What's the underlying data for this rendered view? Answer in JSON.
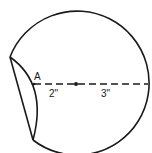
{
  "diagram": {
    "colors": {
      "background": "#ffffff",
      "stroke": "#1a1a1a"
    },
    "point_label": "A",
    "segments": [
      {
        "label": "2\"",
        "from": "A",
        "to": "center"
      },
      {
        "label": "3\"",
        "from": "center",
        "to": "circle-edge"
      }
    ]
  }
}
